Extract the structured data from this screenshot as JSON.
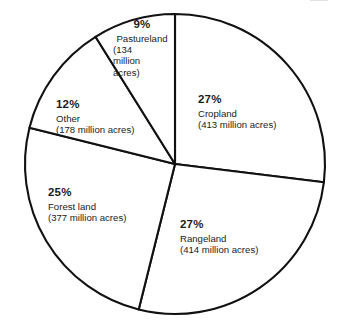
{
  "chart_data": {
    "type": "pie",
    "title": "",
    "subtitle": "",
    "xlabel": "",
    "ylabel": "",
    "legend_position": "inside-slices",
    "grid": false,
    "units": "million acres",
    "categories": [
      "Cropland",
      "Rangeland",
      "Forest land",
      "Other",
      "Pastureland"
    ],
    "values": [
      27,
      27,
      25,
      12,
      9
    ],
    "absolute_values": [
      413,
      414,
      377,
      178,
      134
    ],
    "slices": [
      {
        "name": "Cropland",
        "percent": 27,
        "percent_label": "27%",
        "acres": 413,
        "acres_label": "(413 million acres)",
        "start_angle_deg": 0,
        "end_angle_deg": 97
      },
      {
        "name": "Rangeland",
        "percent": 27,
        "percent_label": "27%",
        "acres": 414,
        "acres_label": "(414 million acres)",
        "start_angle_deg": 97,
        "end_angle_deg": 194
      },
      {
        "name": "Forest land",
        "percent": 25,
        "percent_label": "25%",
        "acres": 377,
        "acres_label": "(377 million acres)",
        "start_angle_deg": 194,
        "end_angle_deg": 284
      },
      {
        "name": "Other",
        "percent": 12,
        "percent_label": "12%",
        "acres": 178,
        "acres_label": "(178 million acres)",
        "start_angle_deg": 284,
        "end_angle_deg": 328
      },
      {
        "name": "Pastureland",
        "percent": 9,
        "percent_label": "9%",
        "acres": 134,
        "acres_label": "(134 million acres)",
        "acres_line_1": "(134",
        "acres_line_2": "million",
        "acres_line_3": "acres)",
        "start_angle_deg": 328,
        "end_angle_deg": 360
      }
    ],
    "colors": {
      "slice_fill": "#ffffff",
      "slice_outline": "#111111",
      "label_text": "#1b1b1b",
      "background": "#ffffff"
    }
  }
}
